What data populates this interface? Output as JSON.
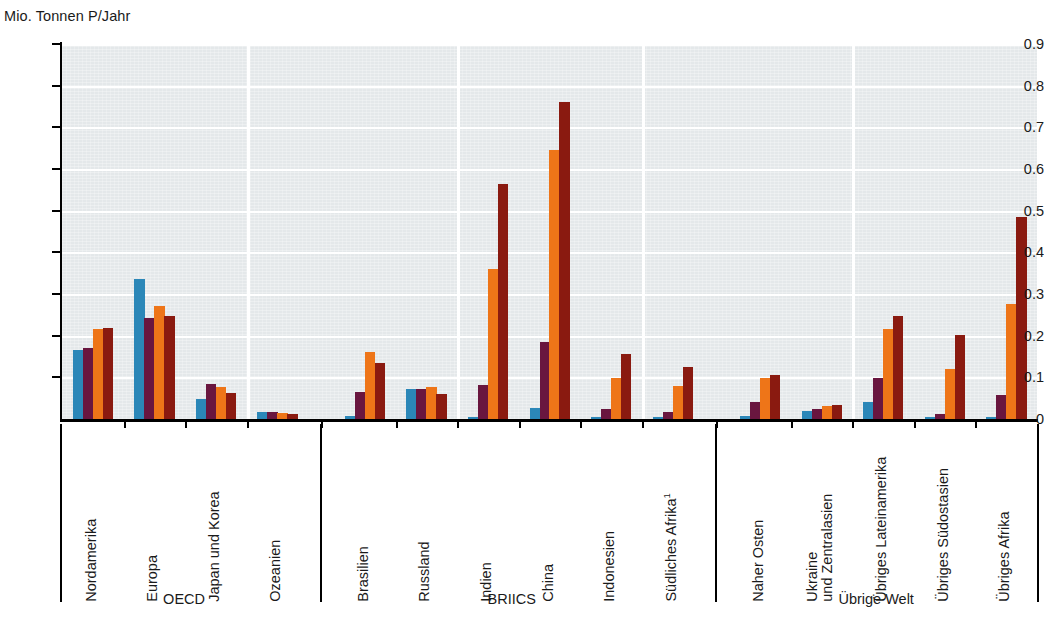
{
  "chart_data": {
    "type": "bar",
    "title": "",
    "ylabel": "Mio. Tonnen P/Jahr",
    "xlabel": "",
    "ylim": [
      0,
      0.9
    ],
    "ytick_labels": [
      "0.9",
      "0.8",
      "0.7",
      "0.6",
      "0.5",
      "0.4",
      "0.3",
      "0.2",
      "0.1",
      "0"
    ],
    "ytick_values": [
      0.9,
      0.8,
      0.7,
      0.6,
      0.5,
      0.4,
      0.3,
      0.2,
      0.1,
      0
    ],
    "grid": "horizontal-and-vertical",
    "legend_position": "top-center-cropped",
    "footnote_marker": "1",
    "categories": [
      "Nordamerika",
      "Europa",
      "Japan und Korea",
      "Ozeanien",
      "Brasilien",
      "Russland",
      "Indien",
      "China",
      "Indonesien",
      "Südliches Afrika",
      "Naher Osten",
      "Ukraine und Zentralasien",
      "Übriges Lateinamerika",
      "Übriges Südostasien",
      "Übriges Afrika"
    ],
    "category_labels": [
      "Nordamerika",
      "Europa",
      "Japan und Korea",
      "Ozeanien",
      "Brasilien",
      "Russland",
      "Indien",
      "China",
      "Indonesien",
      "Südliches Afrika¹",
      "Naher Osten",
      "Ukraine\nund Zentralasien",
      "Übriges Lateinamerika",
      "Übriges Südostasien",
      "Übriges Afrika"
    ],
    "groups": [
      {
        "label": "OECD",
        "categories": [
          "Nordamerika",
          "Europa",
          "Japan und Korea",
          "Ozeanien"
        ]
      },
      {
        "label": "BRIICS",
        "categories": [
          "Brasilien",
          "Russland",
          "Indien",
          "China",
          "Indonesien",
          "Südliches Afrika"
        ]
      },
      {
        "label": "Übrige Welt",
        "categories": [
          "Naher Osten",
          "Ukraine und Zentralasien",
          "Übriges Lateinamerika",
          "Übriges Südostasien",
          "Übriges Afrika"
        ]
      }
    ],
    "series": [
      {
        "name": "Serie 1",
        "color": "#2b87b8",
        "values": [
          0.165,
          0.335,
          0.048,
          0.017,
          0.007,
          0.072,
          0.005,
          0.027,
          0.004,
          0.004,
          0.007,
          0.02,
          0.041,
          0.004,
          0.005
        ]
      },
      {
        "name": "Serie 2",
        "color": "#69163f",
        "values": [
          0.17,
          0.243,
          0.085,
          0.017,
          0.066,
          0.071,
          0.081,
          0.186,
          0.024,
          0.016,
          0.04,
          0.023,
          0.099,
          0.011,
          0.058
        ]
      },
      {
        "name": "Serie 3",
        "color": "#ee7518",
        "values": [
          0.215,
          0.271,
          0.078,
          0.014,
          0.162,
          0.078,
          0.359,
          0.645,
          0.098,
          0.079,
          0.098,
          0.031,
          0.215,
          0.12,
          0.275
        ]
      },
      {
        "name": "Serie 4",
        "color": "#8a1a10",
        "values": [
          0.218,
          0.248,
          0.062,
          0.013,
          0.134,
          0.059,
          0.565,
          0.761,
          0.156,
          0.125,
          0.106,
          0.034,
          0.248,
          0.201,
          0.485
        ]
      }
    ]
  }
}
